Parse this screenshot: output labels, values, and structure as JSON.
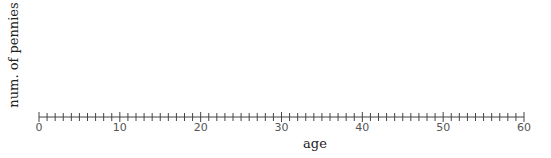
{
  "chart_data": {
    "type": "scatter",
    "title": "",
    "xlabel": "age",
    "ylabel": "num. of pennies",
    "xlim": [
      0,
      60
    ],
    "x_major_ticks": [
      0,
      10,
      20,
      30,
      40,
      50,
      60
    ],
    "x_tick_labels": [
      "0",
      "10",
      "20",
      "30",
      "40",
      "50",
      "60"
    ],
    "x_minor_tick_step": 1,
    "y_axis_visible": false,
    "grid": false,
    "legend": null,
    "points": []
  },
  "layout": {
    "axis_color": "#444444",
    "x0_px": 39,
    "x60_px": 524,
    "axis_y_px": 117
  }
}
